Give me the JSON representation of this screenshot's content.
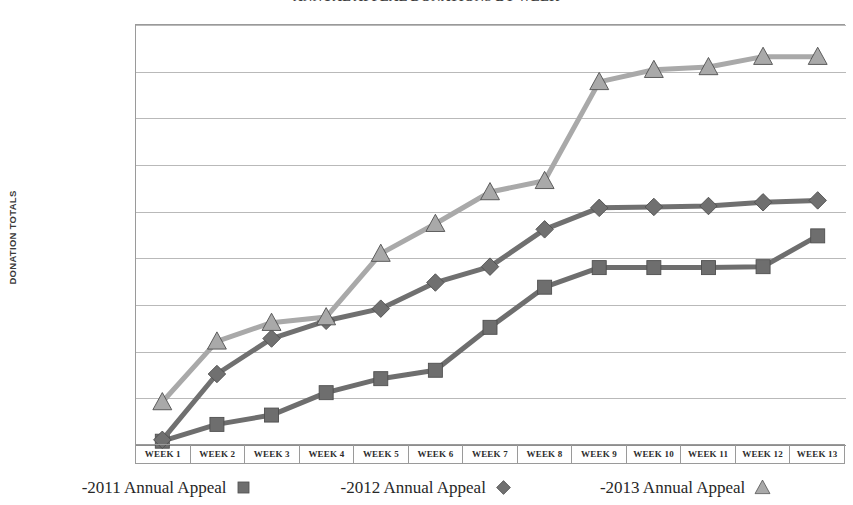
{
  "chart_data": {
    "type": "line",
    "title": "ANNUAL APPEAL DONATIONS BY WEEK",
    "xlabel": "",
    "ylabel": "DONATION TOTALS",
    "ylim": [
      0,
      45000
    ],
    "grid": true,
    "legend_position": "bottom",
    "categories": [
      "WEEK 1",
      "WEEK 2",
      "WEEK 3",
      "WEEK 4",
      "WEEK 5",
      "WEEK 6",
      "WEEK 7",
      "WEEK 8",
      "WEEK 9",
      "WEEK 10",
      "WEEK 11",
      "WEEK 12",
      "WEEK 13"
    ],
    "ytick_labels": [
      "$45,000.00",
      "$40,000.00",
      "$35,000.00",
      "$30,000.00",
      "$25,000.00",
      "$20,000.00",
      "$15,000.00",
      "$10,000.00",
      "$5,000.00",
      "$0.00"
    ],
    "ytick_values": [
      45000,
      40000,
      35000,
      30000,
      25000,
      20000,
      15000,
      10000,
      5000,
      0
    ],
    "series": [
      {
        "name": "-2011 Annual Appeal",
        "marker": "square",
        "color": "#6e6e6e",
        "values": [
          300,
          2100,
          3100,
          5500,
          7000,
          7900,
          12500,
          16800,
          18900,
          18900,
          18900,
          19000,
          22300
        ]
      },
      {
        "name": "-2012 Annual Appeal",
        "marker": "diamond",
        "color": "#707070",
        "values": [
          450,
          7500,
          11300,
          13200,
          14500,
          17300,
          19000,
          23000,
          25300,
          25400,
          25500,
          25900,
          26100
        ]
      },
      {
        "name": "-2013 Annual Appeal",
        "marker": "triangle",
        "color": "#a9a9a9",
        "values": [
          4500,
          11000,
          13000,
          13600,
          20400,
          23600,
          27000,
          28200,
          38800,
          40100,
          40400,
          41500,
          41500
        ]
      }
    ]
  },
  "colors": {
    "series_2011": "#6e6e6e",
    "series_2012": "#707070",
    "series_2013": "#a9a9a9",
    "gridline": "#b9b9b9",
    "axis": "#9a9a9a",
    "text": "#2f2f2f"
  }
}
